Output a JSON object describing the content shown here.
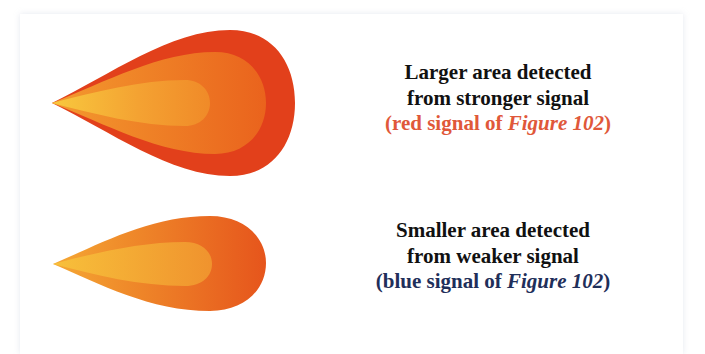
{
  "colors": {
    "outer_red": "#e2401b",
    "middle_orange": "#ec6b1f",
    "inner_orange": "#f3922a",
    "tip_yellow": "#f7c53c",
    "small_outer": "#e8591d",
    "small_mid": "#f0862a",
    "caption_text": "#111111",
    "red_reference": "#e0583a",
    "blue_reference": "#1f2f5a"
  },
  "panels": [
    {
      "shape": "large-detection-area-drop",
      "caption": {
        "line1": "Larger area detected",
        "line2": "from stronger signal",
        "ref_prefix": "(red signal of ",
        "ref_figure": "Figure 102",
        "ref_suffix": ")"
      }
    },
    {
      "shape": "small-detection-area-drop",
      "caption": {
        "line1": "Smaller area detected",
        "line2": "from weaker signal",
        "ref_prefix": "(blue signal of ",
        "ref_figure": "Figure 102",
        "ref_suffix": ")"
      }
    }
  ]
}
